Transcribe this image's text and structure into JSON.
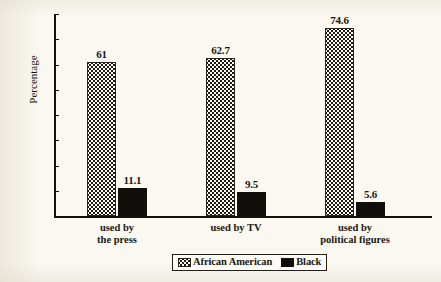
{
  "chart_data": {
    "type": "bar",
    "title": "",
    "subtitle": "",
    "xlabel": "",
    "ylabel": "Percentage",
    "ylim": [
      0,
      80
    ],
    "ytick_step": 10,
    "yticks": [
      "80",
      "70",
      "60",
      "50",
      "40",
      "30",
      "20",
      "10",
      "0"
    ],
    "grid": false,
    "legend_position": "bottom-center",
    "categories": [
      "used by the press",
      "used by TV",
      "used by political figures"
    ],
    "category_lines": [
      [
        "used by",
        "the press"
      ],
      [
        "used by TV"
      ],
      [
        "used by",
        "political figures"
      ]
    ],
    "series": [
      {
        "name": "African American",
        "fill": "dotted",
        "values": [
          61,
          62.7,
          74.6
        ],
        "labels": [
          "61",
          "62.7",
          "74.6"
        ]
      },
      {
        "name": "Black",
        "fill": "solid",
        "values": [
          11.1,
          9.5,
          5.6
        ],
        "labels": [
          "11.1",
          "9.5",
          "5.6"
        ]
      }
    ],
    "colors": {
      "ink": "#14110d",
      "paper": "#faf8f1",
      "dotted_fill": "#fbfaf6",
      "solid_fill": "#100d0a"
    }
  },
  "legend": {
    "items": [
      {
        "label": "African American",
        "swatch": "dotted"
      },
      {
        "label": "Black",
        "swatch": "solid"
      }
    ]
  }
}
